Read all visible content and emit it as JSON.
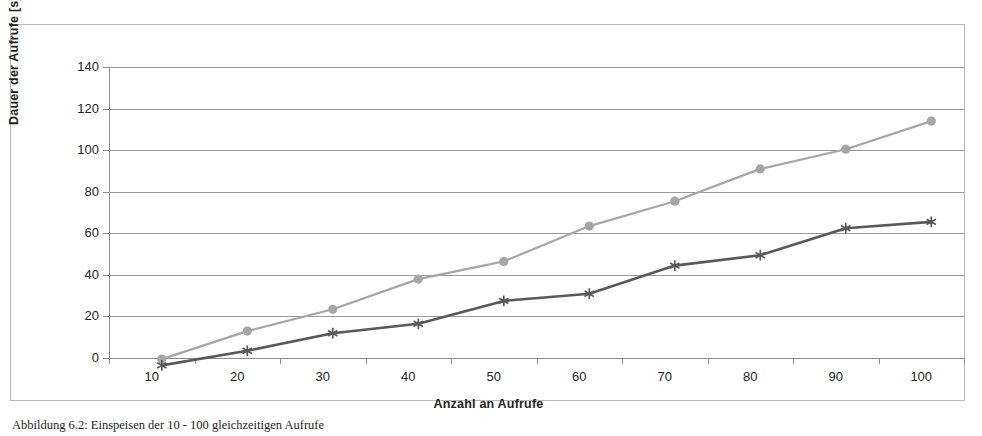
{
  "chart_data": {
    "type": "line",
    "title": "",
    "xlabel": "Anzahl an Aufrufe",
    "ylabel": "Dauer der Aufrufe [s]",
    "categories": [
      10,
      20,
      30,
      40,
      50,
      60,
      70,
      80,
      90,
      100
    ],
    "xtick_labels": [
      "10",
      "20",
      "30",
      "40",
      "50",
      "60",
      "70",
      "80",
      "90",
      "100"
    ],
    "ytick_labels": [
      "0",
      "20",
      "40",
      "60",
      "80",
      "100",
      "120",
      "140"
    ],
    "ytick_values": [
      0,
      20,
      40,
      60,
      80,
      100,
      120,
      140
    ],
    "ylim": [
      0,
      140
    ],
    "grid": "horizontal",
    "legend": "none",
    "series": [
      {
        "name": "series-light-circles",
        "marker": "circle",
        "color": "#a6a6a6",
        "values": [
          11,
          24.5,
          35,
          49.5,
          58,
          75,
          87,
          102.5,
          112,
          125.5
        ]
      },
      {
        "name": "series-dark-stars",
        "marker": "star",
        "color": "#595959",
        "values": [
          8,
          15,
          23.5,
          28,
          39,
          42.5,
          56,
          61,
          74,
          77
        ]
      }
    ]
  },
  "caption": {
    "text": "Abbildung 6.2: Einspeisen der 10 - 100 gleichzeitigen Aufrufe"
  },
  "colors": {
    "series_light": "#a6a6a6",
    "series_dark": "#595959",
    "gridline": "#9a9a9a",
    "axis": "#8f8f8f",
    "frame_border": "#b8b8b8",
    "text": "#231f20",
    "background": "#ffffff"
  }
}
